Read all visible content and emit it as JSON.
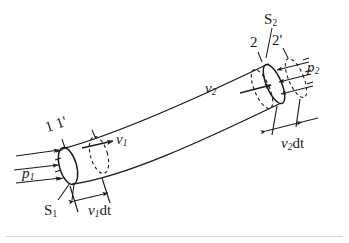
{
  "figure": {
    "kind": "physics-diagram",
    "background_color": "#ffffff",
    "ink_color": "#1b1b1b"
  },
  "labels": {
    "cross_section_1": "S",
    "cross_section_1_sub": "1",
    "cross_section_2": "S",
    "cross_section_2_sub": "2",
    "pressure_1": "p",
    "pressure_1_sub": "1",
    "pressure_2": "p",
    "pressure_2_sub": "2",
    "velocity_1": "v",
    "velocity_1_sub": "1",
    "velocity_2": "v",
    "velocity_2_sub": "2",
    "displacement_1": "v",
    "displacement_1_sub": "1",
    "displacement_1_tail": "dt",
    "displacement_2": "v",
    "displacement_2_sub": "2",
    "displacement_2_tail": "dt",
    "station_1": "1",
    "station_1_prime": "1'",
    "station_2": "2",
    "station_2_prime": "2'"
  },
  "geometry": {
    "tube_left_cap_center": [
      68,
      165
    ],
    "tube_right_cap_center": [
      274,
      84
    ],
    "left_radius_px": 21,
    "right_radius_px": 22,
    "curve_direction": "rises left-to-right"
  }
}
